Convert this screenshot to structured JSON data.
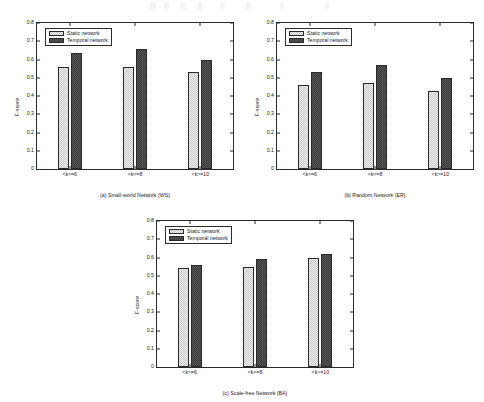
{
  "figure": {
    "background": "#ffffff",
    "axis_color": "#2b2b2b",
    "text_color": "#1a1a1a",
    "static_color": "#c9c9c9",
    "temporal_color": "#3b3b3b"
  },
  "legend": {
    "static_label": "Static network",
    "temporal_label": "Temporal network"
  },
  "axes": {
    "ylabel": "F-score",
    "yticks": [
      "0",
      "0.1",
      "0.2",
      "0.3",
      "0.4",
      "0.5",
      "0.6",
      "0.7",
      "0.8"
    ],
    "xticks": [
      "<k>=6",
      "<k>=8",
      "<k>=10"
    ]
  },
  "captions": {
    "a": "(a) Small-world Network (WS)",
    "b": "(b) Random Network (ER)",
    "c": "(c) Scale-free Network (BA)"
  },
  "chart_data": [
    {
      "type": "bar",
      "panel": "a",
      "title": "(a) Small-world Network (WS)",
      "categories": [
        "<k>=6",
        "<k>=8",
        "<k>=10"
      ],
      "series": [
        {
          "name": "Static network",
          "values": [
            0.56,
            0.56,
            0.53
          ]
        },
        {
          "name": "Temporal network",
          "values": [
            0.635,
            0.66,
            0.595
          ]
        }
      ],
      "xlabel": "",
      "ylabel": "F-score",
      "ylim": [
        0,
        0.8
      ],
      "ytick_step": 0.1,
      "grid": false,
      "legend_position": "top-left"
    },
    {
      "type": "bar",
      "panel": "b",
      "title": "(b) Random Network (ER)",
      "categories": [
        "<k>=6",
        "<k>=8",
        "<k>=10"
      ],
      "series": [
        {
          "name": "Static network",
          "values": [
            0.46,
            0.47,
            0.43
          ]
        },
        {
          "name": "Temporal network",
          "values": [
            0.53,
            0.57,
            0.5
          ]
        }
      ],
      "xlabel": "",
      "ylabel": "F-score",
      "ylim": [
        0,
        0.8
      ],
      "ytick_step": 0.1,
      "grid": false,
      "legend_position": "top-left"
    },
    {
      "type": "bar",
      "panel": "c",
      "title": "(c) Scale-free Network (BA)",
      "categories": [
        "<k>=6",
        "<k>=8",
        "<k>=10"
      ],
      "series": [
        {
          "name": "Static network",
          "values": [
            0.54,
            0.55,
            0.6
          ]
        },
        {
          "name": "Temporal network",
          "values": [
            0.56,
            0.59,
            0.62
          ]
        }
      ],
      "xlabel": "",
      "ylabel": "F-score",
      "ylim": [
        0,
        0.8
      ],
      "ytick_step": 0.1,
      "grid": false,
      "legend_position": "top-left"
    }
  ]
}
